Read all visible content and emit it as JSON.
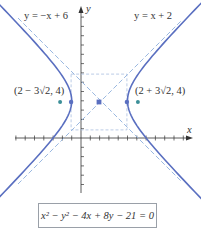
{
  "figure": {
    "equation": "x² − y² − 4x + 8y − 21 = 0",
    "axis_labels": {
      "x": "x",
      "y": "y"
    },
    "asymptote_labels": {
      "left": "y = −x + 6",
      "right": "y = x + 2"
    },
    "focus_labels": {
      "left": "(2 − 3√2, 4)",
      "right": "(2 + 3√2, 4)"
    },
    "colors": {
      "curve": "#5a6fc0",
      "asymptote": "#8fb0dc",
      "guide": "#a9bfe0",
      "focus_point": "#3c8f98",
      "axis": "#333333"
    }
  },
  "chart_data": {
    "type": "diagram",
    "equation": "x^2 - y^2 - 4x + 8y - 21 = 0",
    "standard_form": "(x-2)^2/9 - (y-4)^2/9 = 1",
    "center": [
      2,
      4
    ],
    "vertices": [
      [
        -1,
        4
      ],
      [
        5,
        4
      ]
    ],
    "foci": [
      [
        -2.243,
        4
      ],
      [
        6.243,
        4
      ]
    ],
    "foci_labels": [
      "(2 − 3√2, 4)",
      "(2 + 3√2, 4)"
    ],
    "asymptotes": [
      "y = −x + 6",
      "y = x + 2"
    ],
    "fundamental_rectangle": {
      "x": [
        -1,
        5
      ],
      "y": [
        1,
        7
      ]
    },
    "xlabel": "x",
    "ylabel": "y",
    "xlim": [
      -9,
      13
    ],
    "ylim": [
      -6,
      14
    ]
  }
}
